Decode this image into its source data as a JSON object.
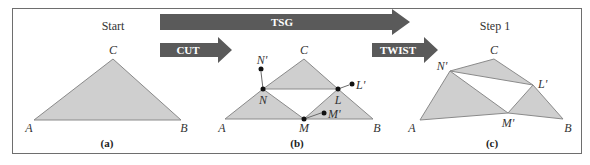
{
  "figure": {
    "arrows": {
      "tsg": {
        "label": "TSG",
        "color": "#5a5a5a"
      },
      "cut": {
        "label": "CUT",
        "color": "#5a5a5a"
      },
      "twist": {
        "label": "TWIST",
        "color": "#5a5a5a"
      }
    },
    "panels": [
      {
        "heading": "Start",
        "caption": "(a)",
        "vertices": {
          "A": "A",
          "B": "B",
          "C": "C"
        }
      },
      {
        "heading": "",
        "caption": "(b)",
        "vertices": {
          "A": "A",
          "B": "B",
          "C": "C",
          "N": "N",
          "L": "L",
          "M": "M",
          "N_prime": "N'",
          "L_prime": "L'",
          "M_prime": "M'"
        }
      },
      {
        "heading": "Step 1",
        "caption": "(c)",
        "vertices": {
          "A": "A",
          "B": "B",
          "C": "C",
          "N_prime": "N'",
          "L_prime": "L'",
          "M_prime": "M'"
        }
      }
    ],
    "fill_color": "#cfcfcf"
  }
}
